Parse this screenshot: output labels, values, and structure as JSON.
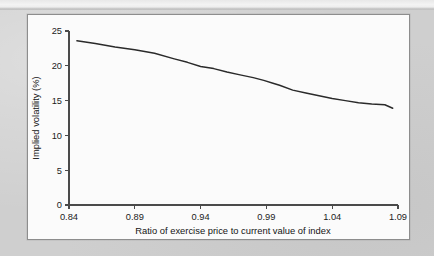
{
  "figure": {
    "panel_background": "#fbfbfb",
    "page_background": "#cfcfcf",
    "line_color": "#2a2a2a",
    "axis_color": "#4a4a4a"
  },
  "chart_data": {
    "type": "line",
    "title": "",
    "xlabel": "Ratio of exercise price to current value of index",
    "ylabel": "Implied volatility (%)",
    "xlim": [
      0.84,
      1.09
    ],
    "ylim": [
      0,
      25
    ],
    "xticks": [
      "0.84",
      "0.89",
      "0.94",
      "0.99",
      "1.04",
      "1.09"
    ],
    "xtick_values": [
      0.84,
      0.89,
      0.94,
      0.99,
      1.04,
      1.09
    ],
    "yticks": [
      "0",
      "5",
      "10",
      "15",
      "20",
      "25"
    ],
    "ytick_values": [
      0,
      5,
      10,
      15,
      20,
      25
    ],
    "grid": false,
    "legend": false,
    "series": [
      {
        "name": "Implied volatility",
        "x": [
          0.846,
          0.86,
          0.875,
          0.89,
          0.905,
          0.92,
          0.93,
          0.94,
          0.95,
          0.96,
          0.97,
          0.98,
          0.988,
          0.995,
          1.0,
          1.01,
          1.02,
          1.03,
          1.04,
          1.05,
          1.06,
          1.07,
          1.08,
          1.086
        ],
        "y": [
          23.6,
          23.2,
          22.7,
          22.3,
          21.8,
          21.0,
          20.5,
          19.9,
          19.6,
          19.1,
          18.7,
          18.3,
          17.9,
          17.5,
          17.2,
          16.5,
          16.1,
          15.7,
          15.3,
          15.0,
          14.7,
          14.5,
          14.4,
          13.9
        ]
      }
    ]
  }
}
